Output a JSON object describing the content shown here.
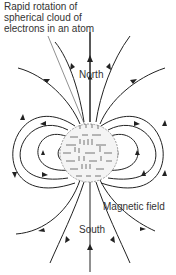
{
  "diagram": {
    "caption_lines": [
      "Rapid rotation of",
      "spherical cloud of",
      "electrons in an atom"
    ],
    "labels": {
      "north": "North",
      "south": "South",
      "magnetic_field": "Magnetic field"
    },
    "colors": {
      "line": "#222222",
      "text": "#333333",
      "sphere_fill": "#f2f2f2",
      "sphere_marks": "#555555"
    }
  }
}
